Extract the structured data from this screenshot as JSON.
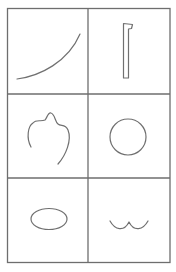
{
  "figure": {
    "colors": {
      "background": "#ffffff",
      "line": "#707070",
      "grid": "#6e6e6e"
    },
    "grid": {
      "rows": 3,
      "columns": 2
    },
    "panels": [
      {
        "row": 1,
        "col": 1,
        "shape": "curve"
      },
      {
        "row": 1,
        "col": 2,
        "shape": "bracket"
      },
      {
        "row": 2,
        "col": 1,
        "shape": "blob"
      },
      {
        "row": 2,
        "col": 2,
        "shape": "circle"
      },
      {
        "row": 3,
        "col": 1,
        "shape": "ellipse"
      },
      {
        "row": 3,
        "col": 2,
        "shape": "wave"
      }
    ]
  }
}
